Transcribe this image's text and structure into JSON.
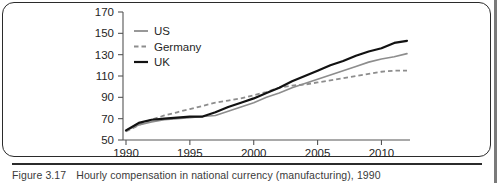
{
  "figure": {
    "caption_label": "Figure 3.17",
    "caption_text": "Hourly compensation in national currency (manufacturing), 1990"
  },
  "chart_data": {
    "type": "line",
    "title": "",
    "xlabel": "",
    "ylabel": "",
    "xlim": [
      1990,
      2012
    ],
    "ylim": [
      50,
      170
    ],
    "xticks": [
      1990,
      1995,
      2000,
      2005,
      2010
    ],
    "yticks": [
      50,
      70,
      90,
      110,
      130,
      150,
      170
    ],
    "grid": false,
    "legend_position": "top-left",
    "x": [
      1990,
      1991,
      1992,
      1993,
      1994,
      1995,
      1996,
      1997,
      1998,
      1999,
      2000,
      2001,
      2002,
      2003,
      2004,
      2005,
      2006,
      2007,
      2008,
      2009,
      2010,
      2011,
      2012
    ],
    "series": [
      {
        "name": "US",
        "style": "solid",
        "color": "#8d8d8d",
        "values": [
          59,
          64,
          67,
          69,
          70,
          71,
          72,
          73,
          77,
          81,
          85,
          90,
          94,
          99,
          103,
          107,
          111,
          115,
          119,
          123,
          126,
          128,
          131
        ]
      },
      {
        "name": "Germany",
        "style": "dashed",
        "color": "#8d8d8d",
        "values": [
          58,
          64,
          69,
          73,
          76,
          79,
          82,
          85,
          87,
          89,
          92,
          95,
          99,
          101,
          102,
          104,
          106,
          108,
          110,
          112,
          114,
          115,
          115
        ]
      },
      {
        "name": "UK",
        "style": "solid",
        "color": "#121212",
        "values": [
          59,
          66,
          69,
          70,
          71,
          72,
          72,
          76,
          81,
          85,
          89,
          94,
          99,
          105,
          110,
          115,
          120,
          124,
          129,
          133,
          136,
          141,
          143
        ]
      }
    ]
  },
  "legend": {
    "items": [
      {
        "label": "US",
        "style": "solid",
        "color": "#8d8d8d"
      },
      {
        "label": "Germany",
        "style": "dashed",
        "color": "#8d8d8d"
      },
      {
        "label": "UK",
        "style": "solid",
        "color": "#121212"
      }
    ]
  }
}
